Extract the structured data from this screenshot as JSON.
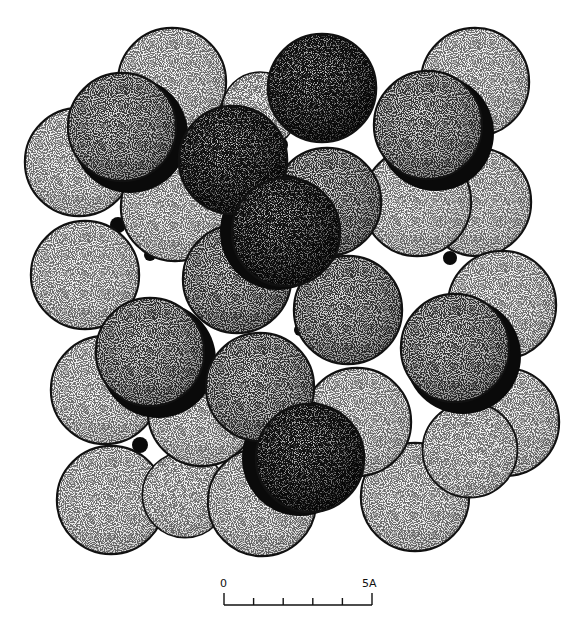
{
  "figure": {
    "colors": {
      "outline": "#111111",
      "light_fill": "#f4f4f4",
      "light_stipple": "#9a9a9a",
      "dark_stipple": "#3a3a3a",
      "shadow": "#0a0a0a",
      "background": "#ffffff"
    }
  },
  "scale_bar": {
    "start_label": "0",
    "end_label": "5A",
    "divisions": 5
  }
}
